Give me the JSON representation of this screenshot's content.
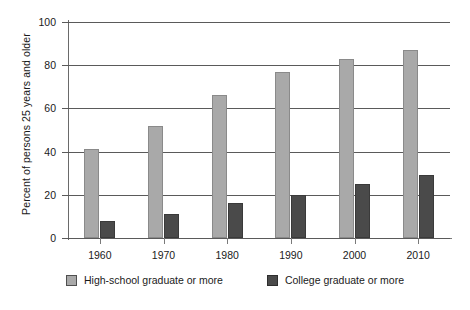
{
  "chart_data": {
    "type": "bar",
    "title": "",
    "subtitle": "",
    "xlabel": "",
    "ylabel": "Percent of persons 25 years and older",
    "categories": [
      "1960",
      "1970",
      "1980",
      "1990",
      "2000",
      "2010"
    ],
    "series": [
      {
        "name": "High-school graduate or more",
        "color": "#a9a9a9",
        "values": [
          41,
          52,
          66,
          77,
          83,
          87
        ]
      },
      {
        "name": "College graduate or more",
        "color": "#4a4a4a",
        "values": [
          8,
          11,
          16,
          20,
          25,
          29
        ]
      }
    ],
    "ylim": [
      0,
      100
    ],
    "yticks": [
      "0",
      "20",
      "40",
      "60",
      "80",
      "100"
    ],
    "grid": "horizontal",
    "legend_position": "bottom"
  },
  "legend": {
    "items": [
      {
        "label": "High-school graduate or more",
        "swatch": "light-gray-swatch-icon"
      },
      {
        "label": "College graduate or more",
        "swatch": "dark-gray-swatch-icon"
      }
    ]
  },
  "colors": {
    "high_school_bar": "#a9a9a9",
    "college_bar": "#4a4a4a",
    "gridline": "#5a5a5a",
    "axis": "#6a6a6a",
    "text": "#1a1a1a",
    "background": "#ffffff"
  }
}
